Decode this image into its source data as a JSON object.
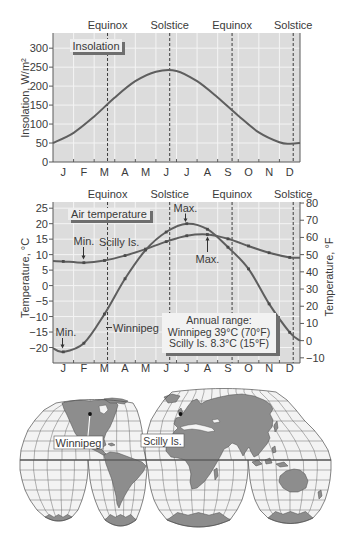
{
  "chart_data": [
    {
      "type": "line",
      "title": "Insolation",
      "xlabel": "",
      "ylabel": "Insolation, W/m²",
      "categories": [
        "J",
        "F",
        "M",
        "A",
        "M",
        "J",
        "J",
        "A",
        "S",
        "O",
        "N",
        "D"
      ],
      "xlim": [
        0,
        12
      ],
      "ylim": [
        0,
        340
      ],
      "yticks": [
        0,
        50,
        100,
        150,
        200,
        250,
        300
      ],
      "ytick_labels": [
        "0",
        "50",
        "100",
        "150",
        "200",
        "250",
        "300"
      ],
      "grid": true,
      "legend": {
        "position": "upper left",
        "entries": [
          "Insolation"
        ]
      },
      "vertical_markers": [
        {
          "label": "Equinox",
          "x": 2.65
        },
        {
          "label": "Solstice",
          "x": 5.67
        },
        {
          "label": "Equinox",
          "x": 8.7
        },
        {
          "label": "Solstice",
          "x": 11.67
        }
      ],
      "series": [
        {
          "name": "Insolation",
          "x": [
            0,
            1,
            2,
            3,
            4,
            5,
            6,
            7,
            8,
            9,
            10,
            11,
            11.5,
            12
          ],
          "values": [
            50,
            77,
            120,
            170,
            213,
            238,
            240,
            213,
            170,
            122,
            78,
            52,
            48,
            50
          ]
        }
      ]
    },
    {
      "type": "line",
      "title": "Air temperature",
      "xlabel": "",
      "ylabel": "Temperature, °C",
      "ylabel_right": "Temperature, °F",
      "categories": [
        "J",
        "F",
        "M",
        "A",
        "M",
        "J",
        "J",
        "A",
        "S",
        "O",
        "N",
        "D"
      ],
      "xlim": [
        0,
        12
      ],
      "ylim": [
        -25,
        27
      ],
      "yticks": [
        25,
        20,
        15,
        10,
        5,
        0,
        -5,
        -10,
        -15,
        -20
      ],
      "ytick_labels": [
        "25",
        "20",
        "15",
        "10",
        "5",
        "0",
        "−5",
        "−10",
        "−15",
        "−20"
      ],
      "yticks_right": [
        80,
        70,
        60,
        50,
        40,
        30,
        20,
        10,
        0,
        -10
      ],
      "ytick_right_labels": [
        "80",
        "70",
        "60",
        "50",
        "40",
        "30",
        "20",
        "10",
        "0",
        "−10"
      ],
      "grid": true,
      "legend": {
        "position": "upper left",
        "entries": [
          "Air temperature"
        ]
      },
      "vertical_markers": [
        {
          "label": "Equinox",
          "x": 2.65
        },
        {
          "label": "Solstice",
          "x": 5.67
        },
        {
          "label": "Equinox",
          "x": 8.7
        },
        {
          "label": "Solstice",
          "x": 11.67
        }
      ],
      "series": [
        {
          "name": "Scilly Is.",
          "x": [
            0,
            0.5,
            1.5,
            2.5,
            3.5,
            4.5,
            5.5,
            6.5,
            7.5,
            8.5,
            9.5,
            10.5,
            11.5,
            12
          ],
          "values": [
            7.9,
            7.8,
            7.4,
            8.1,
            9.7,
            11.8,
            14.2,
            16.1,
            16.5,
            15.1,
            12.8,
            10.6,
            9.1,
            9.0
          ]
        },
        {
          "name": "Winnipeg",
          "x": [
            0,
            0.5,
            1.5,
            2.5,
            3.5,
            4.5,
            5.5,
            6.5,
            7.5,
            8.5,
            9.5,
            10.5,
            11.5,
            12
          ],
          "values": [
            -20.2,
            -21.4,
            -18.6,
            -9.2,
            2.2,
            11.5,
            17.3,
            20.0,
            18.2,
            12.4,
            5.4,
            -5.9,
            -15.1,
            -17.8
          ]
        }
      ],
      "annotations": [
        {
          "text": "Max.",
          "series": "Winnipeg",
          "x": 6.5,
          "y": 20.0
        },
        {
          "text": "Min.",
          "series": "Winnipeg",
          "x": 0.5,
          "y": -21.4
        },
        {
          "text": "Max.",
          "series": "Scilly Is.",
          "x": 7.5,
          "y": 16.5
        },
        {
          "text": "Min.",
          "series": "Scilly Is.",
          "x": 1.5,
          "y": 7.4
        }
      ],
      "annual_range": {
        "title": "Annual range:",
        "lines": [
          "Winnipeg 39°C (70°F)",
          "Scilly Is. 8.3°C (15°F)"
        ]
      }
    }
  ],
  "map": {
    "labels": [
      {
        "text": "Winnipeg"
      },
      {
        "text": "Scilly Is."
      }
    ]
  }
}
